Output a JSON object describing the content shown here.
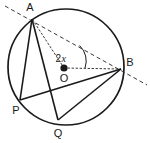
{
  "figure": {
    "type": "circle-geometry-diagram",
    "background_color": "#ffffff",
    "stroke_color": "#1a1a1a",
    "circle": {
      "cx": 66,
      "cy": 67,
      "r": 58,
      "stroke_width": 1.6
    },
    "centre": {
      "label": "O",
      "x": 64,
      "y": 68,
      "dot_radius": 3.4,
      "label_x": 64,
      "label_y": 81
    },
    "points": [
      {
        "name": "A",
        "x": 32,
        "y": 19,
        "label": "A",
        "label_x": 30,
        "label_y": 10
      },
      {
        "name": "B",
        "x": 121,
        "y": 69,
        "label": "B",
        "label_x": 129,
        "label_y": 65
      },
      {
        "name": "P",
        "x": 20,
        "y": 100,
        "label": "P",
        "label_x": 16,
        "label_y": 113
      },
      {
        "name": "Q",
        "x": 58,
        "y": 120,
        "label": "Q",
        "label_x": 58,
        "label_y": 136
      }
    ],
    "solid_chords": [
      {
        "name": "chord-A-P",
        "from": "A",
        "to": "P"
      },
      {
        "name": "chord-A-Q",
        "from": "A",
        "to": "Q"
      },
      {
        "name": "chord-P-B",
        "from": "P",
        "to": "B"
      },
      {
        "name": "chord-Q-B",
        "from": "Q",
        "to": "B"
      }
    ],
    "dashed_lines": [
      {
        "name": "line-A-B-extended",
        "from_x": 6,
        "from_y": 7,
        "to_x": 146,
        "to_y": 84
      }
    ],
    "dotted_radii": [
      {
        "name": "radius-O-A",
        "from_x": 64,
        "from_y": 68,
        "to_x": 32,
        "to_y": 19
      },
      {
        "name": "radius-O-B",
        "from_x": 64,
        "from_y": 68,
        "to_x": 121,
        "to_y": 69
      }
    ],
    "angle_arc": {
      "name": "central-angle-arc",
      "label_number": "2",
      "label_variable": "x",
      "label_x": 62,
      "label_y": 62,
      "path": "M 80 48 A 20 20 0 0 1 84 68"
    }
  }
}
